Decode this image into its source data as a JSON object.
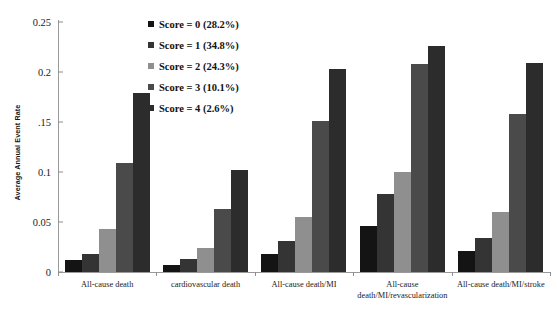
{
  "chart_data": {
    "type": "bar",
    "title": "",
    "xlabel": "",
    "ylabel": "Average Annual Event Rate",
    "ylim": [
      0,
      0.25
    ],
    "ytick_labels": [
      "0.25",
      "0.2",
      ".15",
      "0.1",
      "0.05",
      "0"
    ],
    "ytick_values": [
      0.25,
      0.2,
      0.15,
      0.1,
      0.05,
      0
    ],
    "grid": false,
    "legend_position": "upper-center-left",
    "categories": [
      "All-cause death",
      "cardiovascular death",
      "All-cause death/MI",
      "All-cause death/MI/revascularization",
      "All-cause death/MI/stroke"
    ],
    "series": [
      {
        "name": "Score = 0 (28.2%)",
        "color": "#141414",
        "values": [
          0.012,
          0.007,
          0.018,
          0.046,
          0.021
        ]
      },
      {
        "name": "Score = 1 (34.8%)",
        "color": "#343434",
        "values": [
          0.018,
          0.013,
          0.031,
          0.078,
          0.034
        ]
      },
      {
        "name": "Score = 2 (24.3%)",
        "color": "#8f8f8f",
        "values": [
          0.043,
          0.024,
          0.055,
          0.1,
          0.06
        ]
      },
      {
        "name": "Score = 3 (10.1%)",
        "color": "#4a4a4a",
        "values": [
          0.109,
          0.063,
          0.151,
          0.208,
          0.158
        ]
      },
      {
        "name": "Score = 4 (2.6%)",
        "color": "#2c2c2c",
        "values": [
          0.179,
          0.102,
          0.203,
          0.226,
          0.209
        ]
      }
    ]
  },
  "legend": {
    "items": [
      {
        "label": "Score = 0 (28.2%)",
        "swatch": "#141414"
      },
      {
        "label": "Score = 1 (34.8%)",
        "swatch": "#343434"
      },
      {
        "label": "Score = 2 (24.3%)",
        "swatch": "#8f8f8f"
      },
      {
        "label": "Score = 3 (10.1%)",
        "swatch": "#4a4a4a"
      },
      {
        "label": "Score = 4 (2.6%)",
        "swatch": "#2c2c2c"
      }
    ]
  },
  "axis": {
    "y_title": "Average Annual Event Rate"
  }
}
